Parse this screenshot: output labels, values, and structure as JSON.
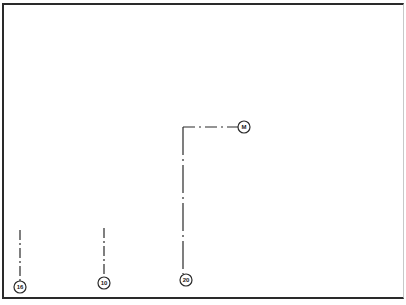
{
  "diagram": {
    "colors": {
      "line": "#2a2a2a",
      "background": "#ffffff"
    },
    "callouts": [
      {
        "label": "16",
        "cx": 20,
        "cy": 287,
        "line": {
          "x1": 20,
          "y1": 230,
          "x2": 20,
          "y2": 281
        }
      },
      {
        "label": "10",
        "cx": 104,
        "cy": 283,
        "line": {
          "x1": 104,
          "y1": 228,
          "x2": 104,
          "y2": 277
        }
      },
      {
        "label": "20",
        "cx": 186,
        "cy": 280,
        "line": {
          "x1": 183,
          "y1": 127,
          "x2": 183,
          "y2": 274
        }
      },
      {
        "label": "M",
        "cx": 244,
        "cy": 127,
        "line": {
          "x1": 183,
          "y1": 127,
          "x2": 238,
          "y2": 127
        }
      }
    ]
  }
}
